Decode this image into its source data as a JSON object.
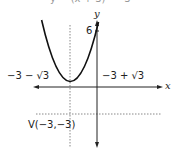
{
  "figure": {
    "type": "parabola-graph",
    "equation_partial": "y = (x + 3)² − 3",
    "axes": {
      "x_label": "x",
      "y_label": "y"
    },
    "y_intercept_tick": "6",
    "root_left_label": "−3 − √3",
    "root_right_label": "−3 + √3",
    "vertex_label": "V(−3,−3)",
    "vertex": {
      "x": -3,
      "y": -3
    },
    "axis_of_symmetry_x": -3,
    "colors": {
      "curve": "#111111",
      "axis": "#222222",
      "dashed": "#888888",
      "text": "#222222"
    }
  }
}
